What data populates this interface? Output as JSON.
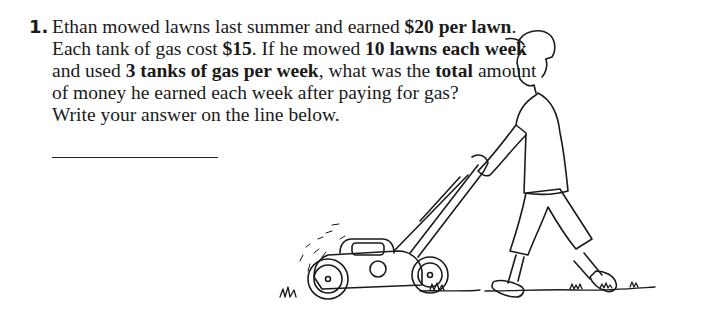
{
  "question": {
    "number": "1.",
    "lines": [
      [
        {
          "t": "Ethan mowed lawns last summer and earned ",
          "b": false
        },
        {
          "t": "$20 per lawn",
          "b": true
        },
        {
          "t": ".",
          "b": false
        }
      ],
      [
        {
          "t": "Each tank of gas cost ",
          "b": false
        },
        {
          "t": "$15",
          "b": true
        },
        {
          "t": ". If he mowed ",
          "b": false
        },
        {
          "t": "10 lawns each week",
          "b": true
        }
      ],
      [
        {
          "t": "and used ",
          "b": false
        },
        {
          "t": "3 tanks of gas per week",
          "b": true
        },
        {
          "t": ", what was the ",
          "b": false
        },
        {
          "t": "total",
          "b": true
        },
        {
          "t": " amount",
          "b": false
        }
      ],
      [
        {
          "t": "of money he earned each week after paying for gas?",
          "b": false
        }
      ],
      [
        {
          "t": "Write your answer on the line below.",
          "b": false
        }
      ]
    ],
    "answer_value": ""
  },
  "illustration": {
    "subject": "boy-pushing-lawn-mower",
    "style": "black line drawing"
  }
}
